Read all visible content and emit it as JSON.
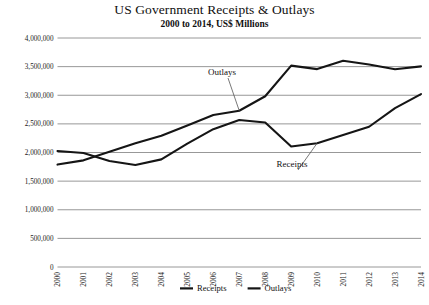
{
  "chart_data": {
    "type": "line",
    "title": "US Government Receipts & Outlays",
    "subtitle": "2000 to 2014, US$ Millions",
    "xlabel": "",
    "ylabel": "",
    "grid": true,
    "legend_position": "bottom",
    "xlim": [
      2000,
      2014
    ],
    "ylim": [
      0,
      4000000
    ],
    "ytick_step": 500000,
    "categories": [
      "2000",
      "2001",
      "2002",
      "2003",
      "2004",
      "2005",
      "2006",
      "2007",
      "2008",
      "2009",
      "2010",
      "2011",
      "2012",
      "2013",
      "2014"
    ],
    "ytick_labels": [
      "0",
      "500,000",
      "1,000,000",
      "1,500,000",
      "2,000,000",
      "2,500,000",
      "3,000,000",
      "3,500,000",
      "4,000,000"
    ],
    "ytick_values": [
      0,
      500000,
      1000000,
      1500000,
      2000000,
      2500000,
      3000000,
      3500000,
      4000000
    ],
    "series": [
      {
        "name": "Receipts",
        "color": "#151515",
        "values": [
          2025000,
          1991000,
          1853000,
          1782000,
          1880000,
          2154000,
          2407000,
          2568000,
          2524000,
          2105000,
          2163000,
          2304000,
          2450000,
          2775000,
          3021000
        ]
      },
      {
        "name": "Outlays",
        "color": "#151515",
        "values": [
          1789000,
          1863000,
          2011000,
          2160000,
          2293000,
          2472000,
          2655000,
          2729000,
          2983000,
          3518000,
          3457000,
          3603000,
          3537000,
          3455000,
          3504000
        ]
      }
    ],
    "annotations": [
      {
        "text": "Outlays",
        "target_year": "2007",
        "label_x": 222,
        "label_y": 75
      },
      {
        "text": "Receipts",
        "target_year": "2010",
        "label_x": 292,
        "label_y": 167
      }
    ],
    "legend": [
      {
        "label": "Receipts"
      },
      {
        "label": "Outlays"
      }
    ]
  }
}
